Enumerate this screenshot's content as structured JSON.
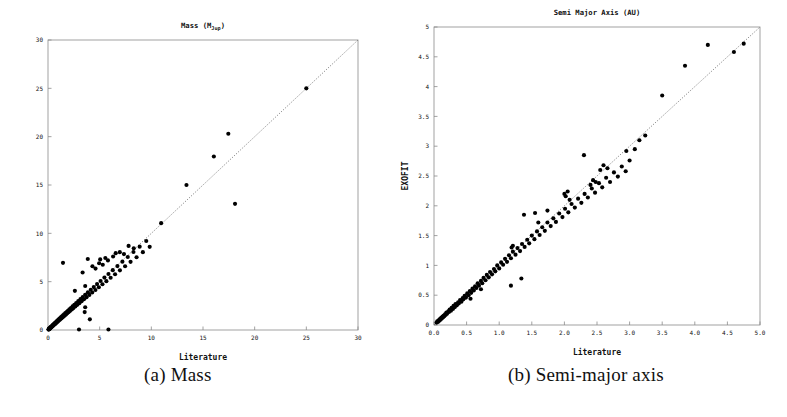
{
  "figure": {
    "caption_a": "(a) Mass",
    "caption_b": "(b) Semi-major axis"
  },
  "chart_data": [
    {
      "panel": "a",
      "type": "scatter",
      "title": "Mass (MJup)",
      "title_main": "Mass  (M",
      "title_sub": "Jup",
      "title_tail": ")",
      "xlabel": "Literature",
      "ylabel": "",
      "xlim": [
        0,
        30
      ],
      "ylim": [
        0,
        30
      ],
      "xticks": [
        "0",
        "5",
        "10",
        "15",
        "20",
        "25",
        "30"
      ],
      "yticks": [
        "0",
        "5",
        "10",
        "15",
        "20",
        "25",
        "30"
      ],
      "grid": false,
      "legend": false,
      "reference_line": {
        "type": "identity",
        "style": "dotted",
        "from": [
          0,
          0
        ],
        "to": [
          30,
          30
        ]
      },
      "marker": {
        "shape": "circle",
        "color": "#000000",
        "size": 3
      },
      "points": [
        [
          0.05,
          0.05
        ],
        [
          0.07,
          0.06
        ],
        [
          0.08,
          0.09
        ],
        [
          0.1,
          0.08
        ],
        [
          0.12,
          0.13
        ],
        [
          0.14,
          0.12
        ],
        [
          0.15,
          0.17
        ],
        [
          0.17,
          0.15
        ],
        [
          0.18,
          0.2
        ],
        [
          0.2,
          0.18
        ],
        [
          0.22,
          0.24
        ],
        [
          0.24,
          0.21
        ],
        [
          0.25,
          0.27
        ],
        [
          0.27,
          0.25
        ],
        [
          0.29,
          0.31
        ],
        [
          0.31,
          0.28
        ],
        [
          0.33,
          0.35
        ],
        [
          0.35,
          0.32
        ],
        [
          0.37,
          0.39
        ],
        [
          0.4,
          0.36
        ],
        [
          0.42,
          0.45
        ],
        [
          0.44,
          0.41
        ],
        [
          0.46,
          0.49
        ],
        [
          0.48,
          0.44
        ],
        [
          0.5,
          0.53
        ],
        [
          0.52,
          0.48
        ],
        [
          0.55,
          0.58
        ],
        [
          0.57,
          0.54
        ],
        [
          0.6,
          0.63
        ],
        [
          0.62,
          0.57
        ],
        [
          0.65,
          0.69
        ],
        [
          0.68,
          0.63
        ],
        [
          0.7,
          0.74
        ],
        [
          0.73,
          0.68
        ],
        [
          0.76,
          0.8
        ],
        [
          0.79,
          0.73
        ],
        [
          0.82,
          0.86
        ],
        [
          0.85,
          0.8
        ],
        [
          0.88,
          0.93
        ],
        [
          0.92,
          0.86
        ],
        [
          0.95,
          1.0
        ],
        [
          0.98,
          0.92
        ],
        [
          1.02,
          1.07
        ],
        [
          1.05,
          0.99
        ],
        [
          1.1,
          1.15
        ],
        [
          1.14,
          1.06
        ],
        [
          1.18,
          1.24
        ],
        [
          1.22,
          1.14
        ],
        [
          1.27,
          1.33
        ],
        [
          1.31,
          1.22
        ],
        [
          1.36,
          1.42
        ],
        [
          1.41,
          1.31
        ],
        [
          1.46,
          1.52
        ],
        [
          1.51,
          1.4
        ],
        [
          1.56,
          1.63
        ],
        [
          1.62,
          1.5
        ],
        [
          1.68,
          1.74
        ],
        [
          1.74,
          1.61
        ],
        [
          1.8,
          1.86
        ],
        [
          1.86,
          1.73
        ],
        [
          1.93,
          1.99
        ],
        [
          2.0,
          1.85
        ],
        [
          2.07,
          2.13
        ],
        [
          2.14,
          1.98
        ],
        [
          2.22,
          2.28
        ],
        [
          2.3,
          2.12
        ],
        [
          2.38,
          2.44
        ],
        [
          2.46,
          2.27
        ],
        [
          2.55,
          2.61
        ],
        [
          2.64,
          2.43
        ],
        [
          2.73,
          2.79
        ],
        [
          2.83,
          2.6
        ],
        [
          2.93,
          2.98
        ],
        [
          3.03,
          2.78
        ],
        [
          3.14,
          3.19
        ],
        [
          3.25,
          2.97
        ],
        [
          3.36,
          3.41
        ],
        [
          3.48,
          3.18
        ],
        [
          3.6,
          3.64
        ],
        [
          3.73,
          3.4
        ],
        [
          3.86,
          3.89
        ],
        [
          4.0,
          3.63
        ],
        [
          4.14,
          4.16
        ],
        [
          4.28,
          3.88
        ],
        [
          4.43,
          4.44
        ],
        [
          4.59,
          4.14
        ],
        [
          4.75,
          4.75
        ],
        [
          4.92,
          4.42
        ],
        [
          5.09,
          5.07
        ],
        [
          5.27,
          4.73
        ],
        [
          5.46,
          5.42
        ],
        [
          5.65,
          5.05
        ],
        [
          5.85,
          5.79
        ],
        [
          6.06,
          5.4
        ],
        [
          6.27,
          6.19
        ],
        [
          6.49,
          5.77
        ],
        [
          6.72,
          6.61
        ],
        [
          6.96,
          6.17
        ],
        [
          7.2,
          7.07
        ],
        [
          7.46,
          6.59
        ],
        [
          7.72,
          7.55
        ],
        [
          7.99,
          7.05
        ],
        [
          8.27,
          8.07
        ],
        [
          8.57,
          7.53
        ],
        [
          8.87,
          8.62
        ],
        [
          9.18,
          8.05
        ],
        [
          9.51,
          9.21
        ],
        [
          9.84,
          8.6
        ],
        [
          1.45,
          6.95
        ],
        [
          2.6,
          4.05
        ],
        [
          3.35,
          5.95
        ],
        [
          3.6,
          4.55
        ],
        [
          3.85,
          7.35
        ],
        [
          4.3,
          6.6
        ],
        [
          4.6,
          6.35
        ],
        [
          4.95,
          6.9
        ],
        [
          5.05,
          7.3
        ],
        [
          5.3,
          6.75
        ],
        [
          5.55,
          7.45
        ],
        [
          5.8,
          7.2
        ],
        [
          6.3,
          7.6
        ],
        [
          6.55,
          7.95
        ],
        [
          6.95,
          8.05
        ],
        [
          7.35,
          7.85
        ],
        [
          7.8,
          8.7
        ],
        [
          8.3,
          8.45
        ],
        [
          3.0,
          0.05
        ],
        [
          5.85,
          0.05
        ],
        [
          3.55,
          1.85
        ],
        [
          3.6,
          2.35
        ],
        [
          4.05,
          1.1
        ],
        [
          10.95,
          11.05
        ],
        [
          13.4,
          15.0
        ],
        [
          16.05,
          17.95
        ],
        [
          17.45,
          20.3
        ],
        [
          18.1,
          13.05
        ],
        [
          25.0,
          25.0
        ]
      ]
    },
    {
      "panel": "b",
      "type": "scatter",
      "title": "Semi Major Axis (AU)",
      "xlabel": "Literature",
      "ylabel": "EXOFIT",
      "xlim": [
        0,
        5
      ],
      "ylim": [
        0,
        5
      ],
      "xticks": [
        "0.0",
        "0.5",
        "1.0",
        "1.5",
        "2.0",
        "2.5",
        "3.0",
        "3.5",
        "4.0",
        "4.5",
        "5.0"
      ],
      "yticks": [
        "0",
        "0.5",
        "1",
        "1.5",
        "2",
        "2.5",
        "3",
        "3.5",
        "4",
        "4.5",
        "5"
      ],
      "grid": false,
      "legend": false,
      "reference_line": {
        "type": "identity",
        "style": "dotted",
        "from": [
          0,
          0
        ],
        "to": [
          5,
          5
        ]
      },
      "marker": {
        "shape": "circle",
        "color": "#000000",
        "size": 3
      },
      "points": [
        [
          0.04,
          0.04
        ],
        [
          0.05,
          0.06
        ],
        [
          0.06,
          0.05
        ],
        [
          0.07,
          0.08
        ],
        [
          0.08,
          0.07
        ],
        [
          0.09,
          0.1
        ],
        [
          0.1,
          0.09
        ],
        [
          0.11,
          0.12
        ],
        [
          0.12,
          0.11
        ],
        [
          0.13,
          0.14
        ],
        [
          0.14,
          0.13
        ],
        [
          0.15,
          0.16
        ],
        [
          0.16,
          0.15
        ],
        [
          0.17,
          0.18
        ],
        [
          0.18,
          0.17
        ],
        [
          0.19,
          0.21
        ],
        [
          0.2,
          0.19
        ],
        [
          0.22,
          0.23
        ],
        [
          0.23,
          0.22
        ],
        [
          0.24,
          0.26
        ],
        [
          0.26,
          0.24
        ],
        [
          0.27,
          0.29
        ],
        [
          0.29,
          0.27
        ],
        [
          0.3,
          0.32
        ],
        [
          0.32,
          0.3
        ],
        [
          0.33,
          0.35
        ],
        [
          0.35,
          0.33
        ],
        [
          0.37,
          0.38
        ],
        [
          0.38,
          0.36
        ],
        [
          0.4,
          0.42
        ],
        [
          0.42,
          0.39
        ],
        [
          0.44,
          0.45
        ],
        [
          0.45,
          0.43
        ],
        [
          0.47,
          0.49
        ],
        [
          0.49,
          0.46
        ],
        [
          0.51,
          0.53
        ],
        [
          0.53,
          0.5
        ],
        [
          0.55,
          0.57
        ],
        [
          0.57,
          0.54
        ],
        [
          0.59,
          0.61
        ],
        [
          0.61,
          0.58
        ],
        [
          0.63,
          0.65
        ],
        [
          0.56,
          0.44
        ],
        [
          0.65,
          0.62
        ],
        [
          0.67,
          0.7
        ],
        [
          0.69,
          0.66
        ],
        [
          0.72,
          0.74
        ],
        [
          0.74,
          0.7
        ],
        [
          0.76,
          0.79
        ],
        [
          0.79,
          0.75
        ],
        [
          0.81,
          0.84
        ],
        [
          0.84,
          0.8
        ],
        [
          0.86,
          0.89
        ],
        [
          0.89,
          0.85
        ],
        [
          0.92,
          0.94
        ],
        [
          0.94,
          0.9
        ],
        [
          0.97,
          1.0
        ],
        [
          1.0,
          0.95
        ],
        [
          1.03,
          1.05
        ],
        [
          1.06,
          1.01
        ],
        [
          1.09,
          1.11
        ],
        [
          1.12,
          1.06
        ],
        [
          1.15,
          1.17
        ],
        [
          1.18,
          1.12
        ],
        [
          1.21,
          1.23
        ],
        [
          1.25,
          1.18
        ],
        [
          1.19,
          1.3
        ],
        [
          1.21,
          1.33
        ],
        [
          1.28,
          1.29
        ],
        [
          1.32,
          1.24
        ],
        [
          1.35,
          1.36
        ],
        [
          1.39,
          1.31
        ],
        [
          1.43,
          1.43
        ],
        [
          1.46,
          1.37
        ],
        [
          1.5,
          1.5
        ],
        [
          1.54,
          1.44
        ],
        [
          1.58,
          1.57
        ],
        [
          1.62,
          1.51
        ],
        [
          1.38,
          1.85
        ],
        [
          1.66,
          1.64
        ],
        [
          1.7,
          1.58
        ],
        [
          1.74,
          1.72
        ],
        [
          1.79,
          1.66
        ],
        [
          1.83,
          1.79
        ],
        [
          1.87,
          1.73
        ],
        [
          1.92,
          1.87
        ],
        [
          1.6,
          1.72
        ],
        [
          1.97,
          1.81
        ],
        [
          2.01,
          1.95
        ],
        [
          2.06,
          1.89
        ],
        [
          2.11,
          2.03
        ],
        [
          2.16,
          1.97
        ],
        [
          2.21,
          2.12
        ],
        [
          2.26,
          2.05
        ],
        [
          2.31,
          2.2
        ],
        [
          2.36,
          2.14
        ],
        [
          2.0,
          2.2
        ],
        [
          2.02,
          2.16
        ],
        [
          2.05,
          2.24
        ],
        [
          2.08,
          2.1
        ],
        [
          2.42,
          2.29
        ],
        [
          2.47,
          2.22
        ],
        [
          2.53,
          2.38
        ],
        [
          2.58,
          2.31
        ],
        [
          2.64,
          2.47
        ],
        [
          2.7,
          2.4
        ],
        [
          2.76,
          2.56
        ],
        [
          2.82,
          2.49
        ],
        [
          2.55,
          2.6
        ],
        [
          2.6,
          2.68
        ],
        [
          2.66,
          2.63
        ],
        [
          2.88,
          2.66
        ],
        [
          2.94,
          2.58
        ],
        [
          3.0,
          2.76
        ],
        [
          2.4,
          2.35
        ],
        [
          2.44,
          2.43
        ],
        [
          2.48,
          2.4
        ],
        [
          1.18,
          0.66
        ],
        [
          1.34,
          0.78
        ],
        [
          0.72,
          0.6
        ],
        [
          2.3,
          2.85
        ],
        [
          3.08,
          2.95
        ],
        [
          3.5,
          3.85
        ],
        [
          3.85,
          4.35
        ],
        [
          4.2,
          4.7
        ],
        [
          3.24,
          3.18
        ],
        [
          4.6,
          4.58
        ],
        [
          4.75,
          4.72
        ],
        [
          2.95,
          2.92
        ],
        [
          3.15,
          3.1
        ],
        [
          1.55,
          1.88
        ],
        [
          1.74,
          1.92
        ]
      ]
    }
  ]
}
